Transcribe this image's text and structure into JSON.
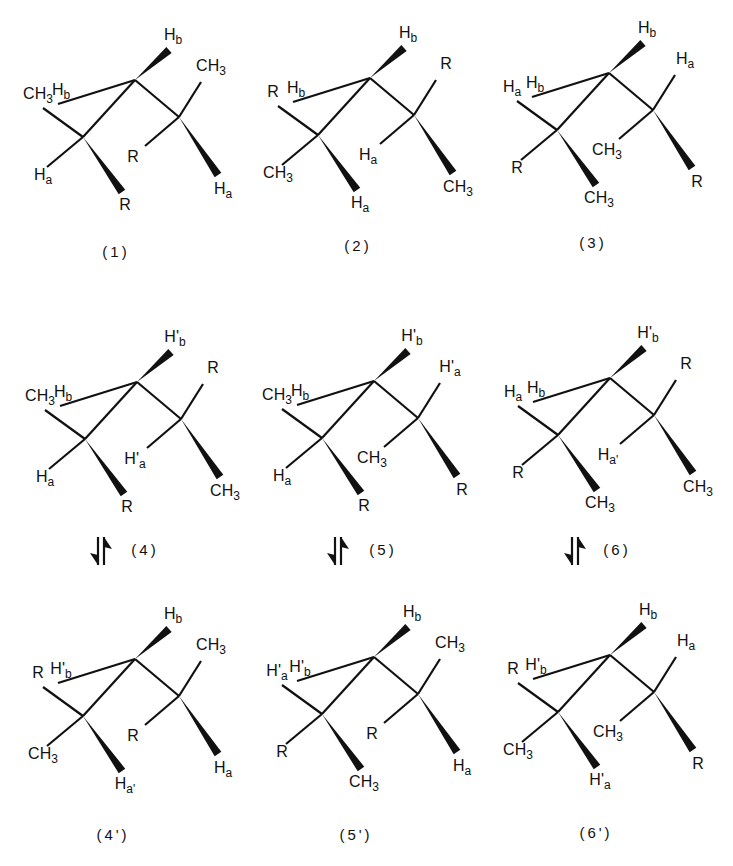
{
  "figure": {
    "skeleton": {
      "atoms": [
        "C-left",
        "C-center",
        "C-right"
      ],
      "positions": {
        "CL_up": "up-left substituent of left carbon",
        "CL_down": "down-left substituent of left carbon",
        "CL_wedge": "wedged (down-right) substituent of left carbon",
        "CC_up": "plain up-left substituent of center carbon",
        "CC_wedge": "wedged up-right substituent of center carbon",
        "CR_up": "up-right substituent of right carbon",
        "CR_down": "down-left substituent of right carbon",
        "CR_wedge": "wedged (down-right) substituent of right carbon"
      }
    },
    "structures": [
      {
        "id": "1",
        "caption": "(1)",
        "CL_up": "CH3",
        "CL_down": "Ha",
        "CL_wedge": "R",
        "CC_up": "Hb",
        "CC_wedge": "Hb",
        "CR_up": "CH3",
        "CR_down": "R",
        "CR_wedge": "Ha"
      },
      {
        "id": "2",
        "caption": "(2)",
        "CL_up": "R",
        "CL_down": "CH3",
        "CL_wedge": "Ha",
        "CC_up": "Hb",
        "CC_wedge": "Hb",
        "CR_up": "R",
        "CR_down": "Ha",
        "CR_wedge": "CH3"
      },
      {
        "id": "3",
        "caption": "(3)",
        "CL_up": "Ha",
        "CL_down": "R",
        "CL_wedge": "CH3",
        "CC_up": "Hb",
        "CC_wedge": "Hb",
        "CR_up": "Ha",
        "CR_down": "CH3",
        "CR_wedge": "R"
      },
      {
        "id": "4",
        "caption": "(4)",
        "CL_up": "CH3",
        "CL_down": "Ha",
        "CL_wedge": "R",
        "CC_up": "Hb",
        "CC_wedge": "H'b",
        "CR_up": "R",
        "CR_down": "H'a",
        "CR_wedge": "CH3"
      },
      {
        "id": "5",
        "caption": "(5)",
        "CL_up": "CH3",
        "CL_down": "Ha",
        "CL_wedge": "R",
        "CC_up": "Hb",
        "CC_wedge": "H'b",
        "CR_up": "H'a",
        "CR_down": "CH3",
        "CR_wedge": "R"
      },
      {
        "id": "6",
        "caption": "(6)",
        "CL_up": "Ha",
        "CL_down": "R",
        "CL_wedge": "CH3",
        "CC_up": "Hb",
        "CC_wedge": "H'b",
        "CR_up": "R",
        "CR_down": "Ha'",
        "CR_wedge": "CH3"
      },
      {
        "id": "4p",
        "caption": "(4')",
        "CL_up": "R",
        "CL_down": "CH3",
        "CL_wedge": "Ha'",
        "CC_up": "H'b",
        "CC_wedge": "Hb",
        "CR_up": "CH3",
        "CR_down": "R",
        "CR_wedge": "Ha"
      },
      {
        "id": "5p",
        "caption": "(5')",
        "CL_up": "H'a",
        "CL_down": "R",
        "CL_wedge": "CH3",
        "CC_up": "H'b",
        "CC_wedge": "Hb",
        "CR_up": "CH3",
        "CR_down": "R",
        "CR_wedge": "Ha"
      },
      {
        "id": "6p",
        "caption": "(6')",
        "CL_up": "R",
        "CL_down": "CH3",
        "CL_wedge": "H'a",
        "CC_up": "H'b",
        "CC_wedge": "Hb",
        "CR_up": "Ha",
        "CR_down": "CH3",
        "CR_wedge": "R"
      }
    ],
    "equilibria": [
      {
        "from": "(4)",
        "to": "(4')",
        "symbol": "equilibrium-arrows"
      },
      {
        "from": "(5)",
        "to": "(5')",
        "symbol": "equilibrium-arrows"
      },
      {
        "from": "(6)",
        "to": "(6')",
        "symbol": "equilibrium-arrows"
      }
    ]
  }
}
